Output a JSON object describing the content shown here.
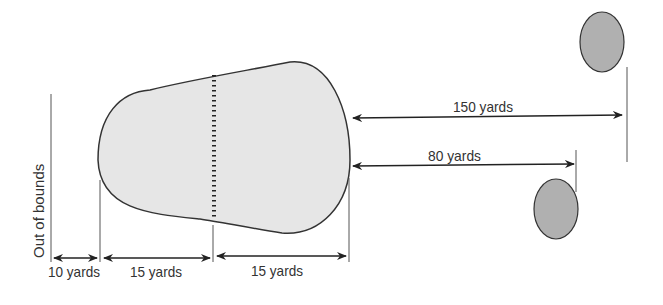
{
  "diagram": {
    "title": "",
    "labels": {
      "out_of_bounds": "Out of bounds",
      "dist_10": "10 yards",
      "dist_15a": "15 yards",
      "dist_15b": "15 yards",
      "dist_150": "150 yards",
      "dist_80": "80 yards"
    },
    "colors": {
      "area_fill": "#e6e6e6",
      "target_fill": "#b0b0b0",
      "line": "#333333"
    }
  }
}
